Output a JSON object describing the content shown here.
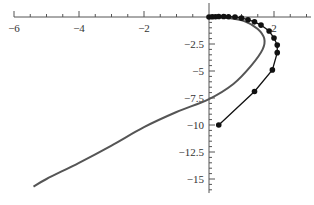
{
  "chart_data": {
    "type": "line",
    "title": "",
    "xlabel": "",
    "ylabel": "",
    "xlim": [
      -6.1,
      3.1
    ],
    "ylim": [
      -16.5,
      0.2
    ],
    "grid": false,
    "legend": null,
    "axes_origin": [
      0,
      0
    ],
    "x_ticks": [
      {
        "value": -6,
        "label": "−6"
      },
      {
        "value": -4,
        "label": "−4"
      },
      {
        "value": -2,
        "label": "−2"
      },
      {
        "value": 2,
        "label": "2"
      }
    ],
    "y_ticks": [
      {
        "value": -2.5,
        "label": "−2.5"
      },
      {
        "value": -5,
        "label": "−5"
      },
      {
        "value": -7.5,
        "label": "−7.5"
      },
      {
        "value": -10,
        "label": "−10"
      },
      {
        "value": -12.5,
        "label": "−12.5"
      },
      {
        "value": -15,
        "label": "−15"
      }
    ],
    "series": [
      {
        "name": "curve-gray",
        "style": "smooth-line",
        "color": "#555555",
        "points": [
          [
            0.0,
            0.0
          ],
          [
            0.6,
            -0.1
          ],
          [
            1.1,
            -0.4
          ],
          [
            1.5,
            -1.1
          ],
          [
            1.7,
            -2.0
          ],
          [
            1.65,
            -3.0
          ],
          [
            1.3,
            -4.5
          ],
          [
            0.75,
            -6.2
          ],
          [
            0.0,
            -7.6
          ],
          [
            -1.0,
            -8.8
          ],
          [
            -2.0,
            -10.2
          ],
          [
            -3.0,
            -11.9
          ],
          [
            -4.0,
            -13.5
          ],
          [
            -5.0,
            -15.0
          ],
          [
            -5.4,
            -15.7
          ]
        ]
      },
      {
        "name": "points-black",
        "style": "line-with-markers",
        "color": "#111111",
        "points": [
          [
            0.0,
            0.0
          ],
          [
            0.1,
            0.02
          ],
          [
            0.2,
            0.03
          ],
          [
            0.3,
            0.04
          ],
          [
            0.45,
            0.04
          ],
          [
            0.6,
            0.03
          ],
          [
            0.8,
            0.0
          ],
          [
            1.0,
            -0.1
          ],
          [
            1.2,
            -0.25
          ],
          [
            1.4,
            -0.45
          ],
          [
            1.6,
            -0.75
          ],
          [
            1.85,
            -1.3
          ],
          [
            2.0,
            -1.95
          ],
          [
            2.1,
            -2.6
          ],
          [
            2.1,
            -3.3
          ],
          [
            1.95,
            -4.9
          ],
          [
            1.4,
            -6.9
          ],
          [
            0.3,
            -10.0
          ]
        ]
      }
    ]
  }
}
